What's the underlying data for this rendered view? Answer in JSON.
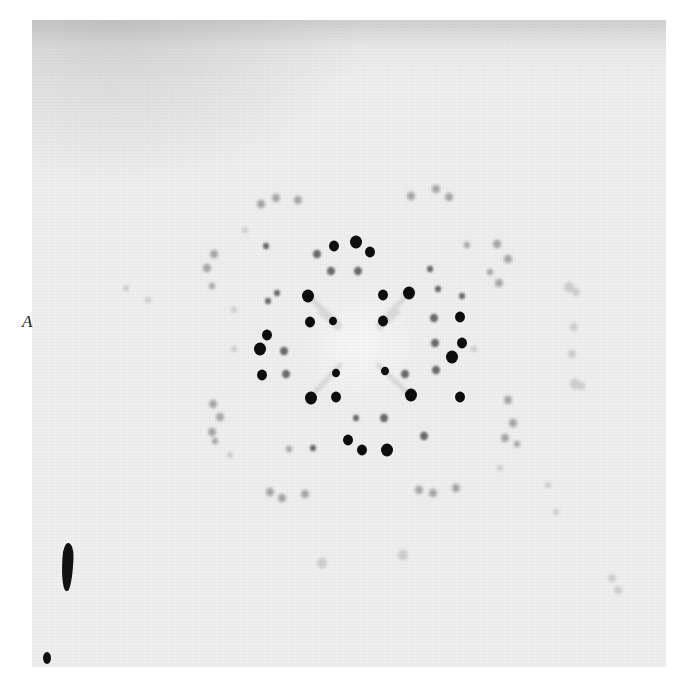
{
  "figure": {
    "panel_label": "A",
    "colors": {
      "page_background": "#ffffff",
      "film_background": "#efefef",
      "strong_spot": "#111111",
      "medium_spot": "#6a6a6a",
      "weak_spot": "#a6a6a6",
      "faint_spot": "#cfcfcf"
    },
    "photo_box": {
      "x": 32,
      "y": 20,
      "width": 634,
      "height": 647
    },
    "pattern_center": {
      "x": 360,
      "y": 344
    },
    "caption_visible": false
  },
  "spots": {
    "strong": [
      [
        356,
        242,
        6
      ],
      [
        334,
        246,
        5
      ],
      [
        370,
        252,
        5
      ],
      [
        308,
        296,
        6
      ],
      [
        409,
        293,
        6
      ],
      [
        310,
        322,
        5
      ],
      [
        333,
        321,
        4
      ],
      [
        383,
        321,
        5
      ],
      [
        383,
        295,
        5
      ],
      [
        460,
        317,
        5
      ],
      [
        267,
        335,
        5
      ],
      [
        260,
        349,
        6
      ],
      [
        462,
        343,
        5
      ],
      [
        452,
        357,
        6
      ],
      [
        262,
        375,
        5
      ],
      [
        311,
        398,
        6
      ],
      [
        336,
        397,
        5
      ],
      [
        411,
        395,
        6
      ],
      [
        460,
        397,
        5
      ],
      [
        348,
        440,
        5
      ],
      [
        362,
        450,
        5
      ],
      [
        387,
        450,
        6
      ],
      [
        385,
        371,
        4
      ],
      [
        336,
        373,
        4
      ]
    ],
    "medium": [
      [
        317,
        254,
        4
      ],
      [
        331,
        271,
        4
      ],
      [
        358,
        271,
        4
      ],
      [
        430,
        269,
        3
      ],
      [
        438,
        289,
        3
      ],
      [
        462,
        296,
        3
      ],
      [
        434,
        318,
        4
      ],
      [
        284,
        351,
        4
      ],
      [
        286,
        374,
        4
      ],
      [
        435,
        343,
        4
      ],
      [
        436,
        370,
        4
      ],
      [
        313,
        448,
        3
      ],
      [
        268,
        301,
        3
      ],
      [
        277,
        293,
        3
      ],
      [
        405,
        374,
        4
      ],
      [
        356,
        418,
        3
      ],
      [
        384,
        418,
        4
      ],
      [
        424,
        436,
        4
      ],
      [
        266,
        246,
        3
      ]
    ],
    "weak": [
      [
        261,
        204,
        4
      ],
      [
        276,
        198,
        4
      ],
      [
        298,
        200,
        4
      ],
      [
        411,
        196,
        4
      ],
      [
        436,
        189,
        4
      ],
      [
        449,
        197,
        4
      ],
      [
        214,
        254,
        4
      ],
      [
        207,
        268,
        4
      ],
      [
        212,
        286,
        3
      ],
      [
        497,
        244,
        4
      ],
      [
        508,
        259,
        4
      ],
      [
        499,
        283,
        4
      ],
      [
        213,
        404,
        4
      ],
      [
        220,
        417,
        4
      ],
      [
        212,
        432,
        4
      ],
      [
        508,
        400,
        4
      ],
      [
        513,
        423,
        4
      ],
      [
        505,
        438,
        4
      ],
      [
        270,
        492,
        4
      ],
      [
        282,
        498,
        4
      ],
      [
        305,
        494,
        4
      ],
      [
        419,
        490,
        4
      ],
      [
        433,
        493,
        4
      ],
      [
        456,
        488,
        4
      ],
      [
        517,
        444,
        3
      ],
      [
        215,
        441,
        3
      ],
      [
        467,
        245,
        3
      ],
      [
        490,
        272,
        3
      ],
      [
        289,
        449,
        3
      ]
    ],
    "faint": [
      [
        569,
        287,
        5
      ],
      [
        576,
        292,
        4
      ],
      [
        574,
        327,
        4
      ],
      [
        572,
        354,
        4
      ],
      [
        575,
        384,
        5
      ],
      [
        581,
        386,
        4
      ],
      [
        322,
        563,
        5
      ],
      [
        403,
        555,
        5
      ],
      [
        548,
        485,
        3
      ],
      [
        556,
        512,
        3
      ],
      [
        126,
        288,
        3
      ],
      [
        148,
        300,
        3
      ],
      [
        234,
        310,
        3
      ],
      [
        234,
        349,
        3
      ],
      [
        474,
        349,
        3
      ],
      [
        245,
        230,
        3
      ],
      [
        230,
        455,
        3
      ],
      [
        500,
        468,
        3
      ],
      [
        612,
        578,
        4
      ],
      [
        618,
        590,
        4
      ]
    ]
  }
}
